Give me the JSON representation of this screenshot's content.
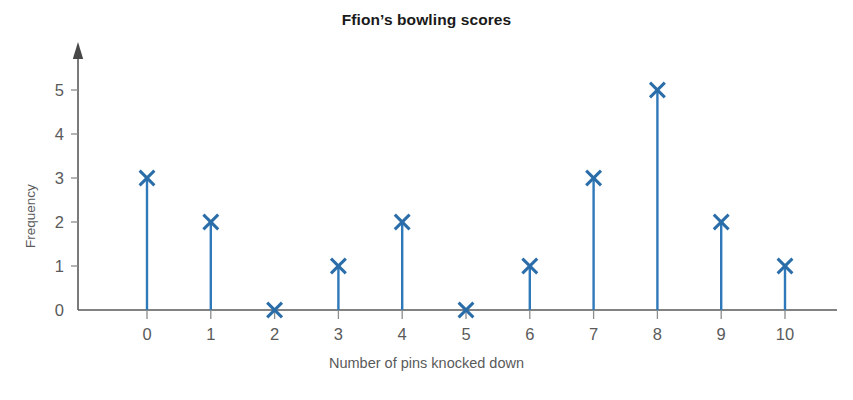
{
  "chart_data": {
    "type": "bar",
    "variant": "vertical-line-graph",
    "title": "Ffion’s bowling scores",
    "xlabel": "Number of pins knocked down",
    "ylabel": "Frequency",
    "categories": [
      "0",
      "1",
      "2",
      "3",
      "4",
      "5",
      "6",
      "7",
      "8",
      "9",
      "10"
    ],
    "values": [
      3,
      2,
      0,
      1,
      2,
      0,
      1,
      3,
      5,
      2,
      1
    ],
    "ylim": [
      0,
      5
    ],
    "yticks": [
      "0",
      "1",
      "2",
      "3",
      "4",
      "5"
    ],
    "xticks": [
      "0",
      "1",
      "2",
      "3",
      "4",
      "5",
      "6",
      "7",
      "8",
      "9",
      "10"
    ],
    "grid": false,
    "legend": false,
    "marker": "x",
    "series_color": "#2f79ba",
    "marker_color": "#2a6da8",
    "axis_color": "#595959",
    "text_color": "#5a5a5a",
    "title_color": "#1a1a1a",
    "y_axis_arrow": true
  }
}
